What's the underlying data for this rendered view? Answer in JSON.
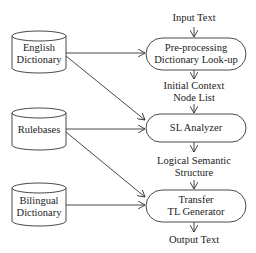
{
  "diagram": {
    "resources": [
      {
        "id": "english-dictionary",
        "lines": [
          "English",
          "Dictionary"
        ]
      },
      {
        "id": "rulebases",
        "lines": [
          "Rulebases"
        ]
      },
      {
        "id": "bilingual-dictionary",
        "lines": [
          "Bilingual",
          "Dictionary"
        ]
      }
    ],
    "processes": [
      {
        "id": "preprocessing",
        "lines": [
          "Pre-processing",
          "Dictionary Look-up"
        ]
      },
      {
        "id": "sl-analyzer",
        "lines": [
          "SL Analyzer"
        ]
      },
      {
        "id": "transfer",
        "lines": [
          "Transfer",
          "TL Generator"
        ]
      }
    ],
    "flow_labels": {
      "input": "Input Text",
      "intermediate1": [
        "Initial Context",
        "Node List"
      ],
      "intermediate2": [
        "Logical Semantic",
        "Structure"
      ],
      "output": "Output Text"
    },
    "edges": [
      {
        "from": "english-dictionary",
        "to": "preprocessing"
      },
      {
        "from": "english-dictionary",
        "to": "sl-analyzer"
      },
      {
        "from": "rulebases",
        "to": "sl-analyzer"
      },
      {
        "from": "rulebases",
        "to": "transfer"
      },
      {
        "from": "bilingual-dictionary",
        "to": "transfer"
      }
    ],
    "colors": {
      "stroke": "#333333",
      "background": "#ffffff"
    }
  }
}
